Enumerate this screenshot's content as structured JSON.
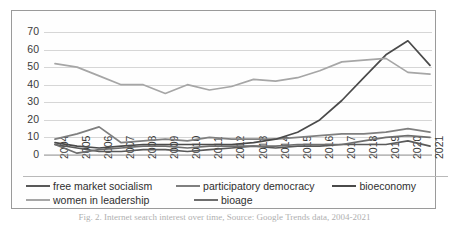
{
  "chart_data": {
    "type": "line",
    "title": "",
    "xlabel": "",
    "ylabel": "",
    "ylim": [
      0,
      70
    ],
    "ytick_step": 10,
    "grid": true,
    "legend_position": "bottom",
    "categories": [
      "2004",
      "2005",
      "2006",
      "2007",
      "2008",
      "2009",
      "2010",
      "2011",
      "2012",
      "2013",
      "2014",
      "2015",
      "2016",
      "2017",
      "2018",
      "2019",
      "2020",
      "2021"
    ],
    "yticks": [
      "0",
      "10",
      "20",
      "30",
      "40",
      "50",
      "60",
      "70"
    ],
    "series": [
      {
        "name": "free market socialism",
        "color": "#595959",
        "values": [
          6,
          4,
          2,
          2,
          3,
          3,
          2,
          3,
          4,
          5,
          4,
          5,
          5,
          6,
          6,
          6,
          8,
          5
        ]
      },
      {
        "name": "participatory democracy",
        "color": "#7f7f7f",
        "values": [
          9,
          12,
          16,
          7,
          8,
          9,
          8,
          10,
          9,
          9,
          9,
          10,
          11,
          12,
          12,
          13,
          15,
          13
        ]
      },
      {
        "name": "bioeconomy",
        "color": "#4a4a4a",
        "values": [
          7,
          5,
          4,
          5,
          6,
          6,
          6,
          6,
          6,
          7,
          9,
          13,
          20,
          31,
          44,
          57,
          65,
          51
        ]
      },
      {
        "name": "women in leadership",
        "color": "#a6a6a6",
        "values": [
          52,
          50,
          45,
          40,
          40,
          35,
          40,
          37,
          39,
          43,
          42,
          44,
          48,
          53,
          54,
          55,
          47,
          46
        ]
      },
      {
        "name": "bioage",
        "color": "#6e6e6e",
        "values": [
          6,
          1,
          3,
          4,
          5,
          5,
          4,
          5,
          5,
          5,
          5,
          6,
          6,
          6,
          8,
          10,
          11,
          10
        ]
      }
    ]
  },
  "caption": "Fig. 2.  Internet search interest over time, Source: Google Trends data, 2004-2021"
}
